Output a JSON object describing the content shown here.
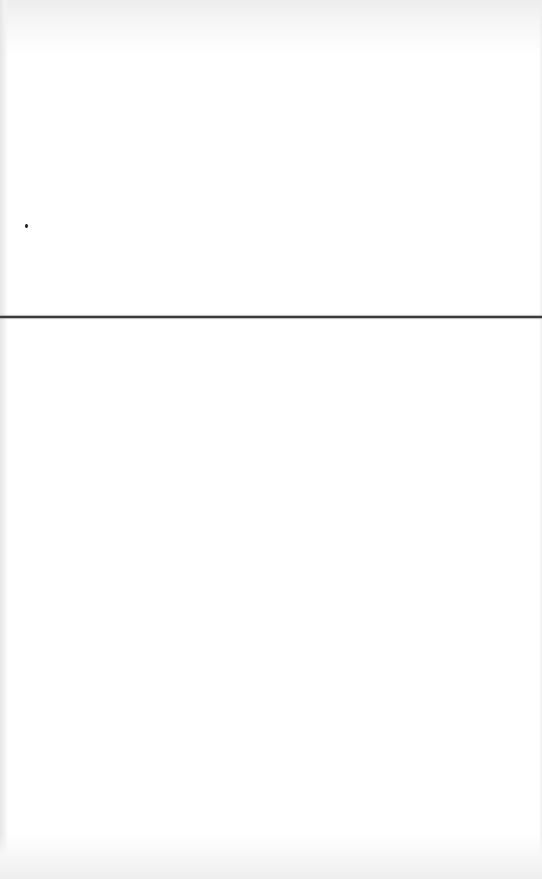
{
  "document": {
    "type": "scanned-page",
    "text": "",
    "elements": [
      {
        "kind": "horizontal-rule",
        "y": 317,
        "color": "#3a3a3a"
      },
      {
        "kind": "ink-dot",
        "x": 25,
        "y": 226,
        "color": "#1a1a1a"
      }
    ]
  },
  "colors": {
    "page_background": "#ffffff",
    "rule": "#3a3a3a",
    "scan_edge": "#e6e6e6"
  }
}
